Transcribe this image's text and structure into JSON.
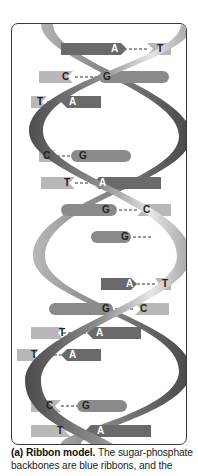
{
  "figure": {
    "panel_label": "(a)",
    "title": "Ribbon model.",
    "caption_text": "The sugar-phosphate backbones are blue ribbons, and the",
    "colors": {
      "backbone_light": "#d8d8d8",
      "backbone_mid": "#9a9a9a",
      "backbone_dark": "#555555",
      "base_light": "#b8b8b8",
      "base_dark": "#6a6a6a",
      "frame_border": "#3a3a3a"
    },
    "base_pairs": [
      {
        "left": "A",
        "right": "T",
        "y": 48
      },
      {
        "left": "C",
        "right": "G",
        "y": 76
      },
      {
        "left": "T",
        "right": "A",
        "y": 101
      },
      {
        "left": "C",
        "right": "G",
        "y": 155
      },
      {
        "left": "T",
        "right": "A",
        "y": 182
      },
      {
        "left": "G",
        "right": "C",
        "y": 209
      },
      {
        "left": "G",
        "right": "",
        "y": 236
      },
      {
        "left": "A",
        "right": "T",
        "y": 283
      },
      {
        "left": "G",
        "right": "C",
        "y": 308
      },
      {
        "left": "T",
        "right": "A",
        "y": 332
      },
      {
        "left": "T",
        "right": "A",
        "y": 354
      },
      {
        "left": "C",
        "right": "G",
        "y": 405
      },
      {
        "left": "T",
        "right": "A",
        "y": 430
      }
    ]
  }
}
